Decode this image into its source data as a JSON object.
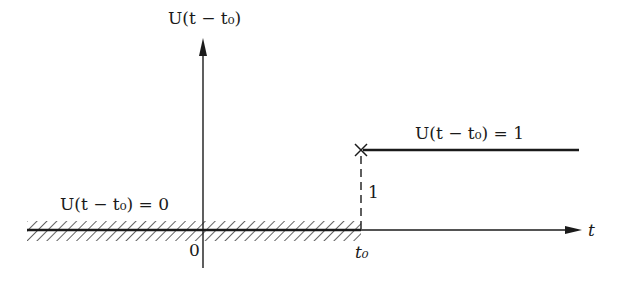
{
  "figure": {
    "y_axis_label": "U(t − t₀)",
    "x_axis_label": "t",
    "origin_label": "0",
    "t0_label": "t₀",
    "step_height_label": "1",
    "region_before_label": "U(t − t₀) = 0",
    "region_after_label": "U(t − t₀) = 1",
    "colors": {
      "ink": "#1a1a1a",
      "background": "#ffffff"
    }
  },
  "geometry": {
    "origin_x": 203,
    "axis_y": 230,
    "t0_x": 361,
    "step_y": 150,
    "x_axis_start": 27,
    "x_axis_end": 582,
    "y_axis_top": 38,
    "y_axis_bottom": 268,
    "step_end_x": 579,
    "hatch_top": 221,
    "hatch_bottom": 241
  }
}
